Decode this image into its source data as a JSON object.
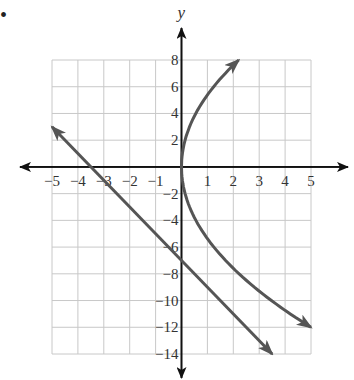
{
  "bullet": "•",
  "chart_data": {
    "type": "line",
    "title": "",
    "xlabel": "x",
    "ylabel": "y",
    "xlim": [
      -5,
      5
    ],
    "ylim": [
      -14,
      8
    ],
    "grid": true,
    "x_ticks": [
      -5,
      -4,
      -3,
      -2,
      -1,
      1,
      2,
      3,
      4,
      5
    ],
    "y_ticks": [
      8,
      6,
      4,
      2,
      -2,
      -4,
      -6,
      -8,
      -10,
      -12,
      -14
    ],
    "x_tick_labels": [
      "−5",
      "−4",
      "−3",
      "−2",
      "−1",
      "1",
      "2",
      "3",
      "4",
      "5"
    ],
    "y_tick_labels": [
      "8",
      "6",
      "4",
      "2",
      "−2",
      "−4",
      "−6",
      "−8",
      "−10",
      "−12",
      "−14"
    ],
    "series": [
      {
        "name": "line",
        "kind": "linear",
        "equation": "y = -2x - 7",
        "points": [
          [
            -5,
            3
          ],
          [
            -3.5,
            0
          ],
          [
            0,
            -7
          ],
          [
            3.5,
            -14
          ]
        ],
        "arrows": "both ends",
        "color": "#555555"
      },
      {
        "name": "parabola",
        "kind": "sideways parabola",
        "equation": "x ≈ y²/32 (opens right, vertex near origin)",
        "points": [
          [
            2.2,
            8
          ],
          [
            0.5,
            4
          ],
          [
            0,
            0
          ],
          [
            0.5,
            -4
          ],
          [
            2,
            -8
          ],
          [
            5,
            -12
          ]
        ],
        "arrows": "both ends",
        "color": "#555555"
      }
    ]
  }
}
